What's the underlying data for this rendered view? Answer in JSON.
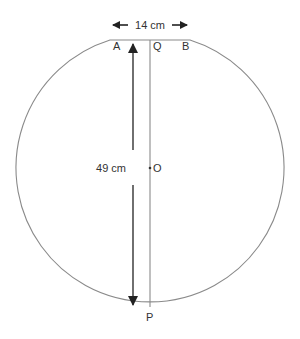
{
  "diagram": {
    "width_label": "14 cm",
    "height_label": "49 cm",
    "points": {
      "A": "A",
      "Q": "Q",
      "B": "B",
      "O": "O",
      "P": "P"
    },
    "colors": {
      "stroke": "#8a8a8a",
      "arrow": "#222222",
      "text": "#333333"
    }
  }
}
